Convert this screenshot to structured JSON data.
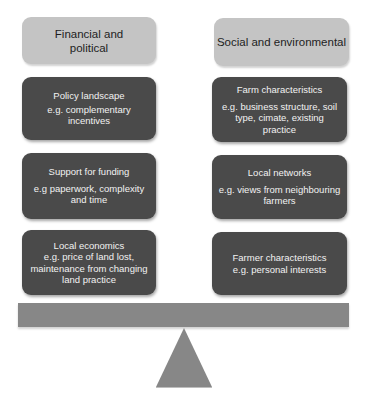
{
  "diagram": {
    "type": "balance-scale",
    "left_column": {
      "header": "Financial and\npolitical",
      "items": [
        {
          "title": "Policy landscape",
          "detail": "e.g. complementary incentives"
        },
        {
          "title": "Support for funding",
          "detail": "e.g paperwork, complexity\nand time"
        },
        {
          "title": "Local economics",
          "detail": "e.g. price of land lost,\nmaintenance from changing\nland practice"
        }
      ]
    },
    "right_column": {
      "header": "Social and environmental",
      "items": [
        {
          "title": "Farm characteristics",
          "detail": "e.g. business structure, soil\ntype, cimate, existing practice"
        },
        {
          "title": "Local networks",
          "detail": "e.g. views from neighbouring\nfarmers"
        },
        {
          "title": "Farmer characteristics",
          "detail": "e.g. personal interests"
        }
      ]
    },
    "colors": {
      "header_fill": "#c4c4c4",
      "item_fill": "#4a4a4a",
      "item_text": "#f2f2f2",
      "beam": "#878787",
      "fulcrum": "#878787"
    }
  }
}
